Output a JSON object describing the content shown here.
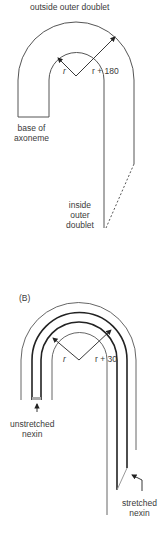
{
  "panelA": {
    "title_label": "outside outer doublet",
    "radius_inner_label": "r",
    "radius_outer_label": "r + 180",
    "base_label_line1": "base of",
    "base_label_line2": "axoneme",
    "inside_label_line1": "inside",
    "inside_label_line2": "outer",
    "inside_label_line3": "doublet"
  },
  "panelB": {
    "panel_label": "(B)",
    "radius_inner_label": "r",
    "radius_outer_label": "r + 30",
    "unstretched_label_line1": "unstretched",
    "unstretched_label_line2": "nexin",
    "stretched_label_line1": "stretched",
    "stretched_label_line2": "nexin"
  },
  "colors": {
    "line": "#555555",
    "thick_line": "#222222",
    "nexin": "#999999"
  }
}
